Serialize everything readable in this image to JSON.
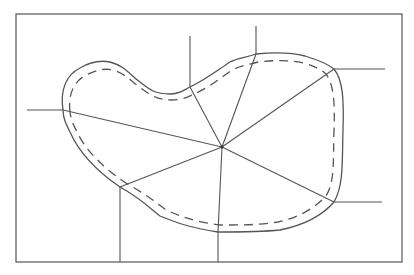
{
  "diagram": {
    "colors": {
      "line": "#555555",
      "background": "#ffffff"
    },
    "frame": {
      "x": 16,
      "y": 14,
      "width": 386,
      "height": 248
    },
    "center": {
      "x": 222,
      "y": 147
    },
    "boundary_points": [
      {
        "name": "left",
        "x": 63,
        "y": 110,
        "external_end": {
          "x": 27,
          "y": 110
        }
      },
      {
        "name": "top-left",
        "x": 190,
        "y": 87,
        "external_end": {
          "x": 190,
          "y": 36
        }
      },
      {
        "name": "top",
        "x": 256,
        "y": 54,
        "external_end": {
          "x": 256,
          "y": 26
        }
      },
      {
        "name": "right-top",
        "x": 334,
        "y": 69,
        "external_end": {
          "x": 385,
          "y": 69
        }
      },
      {
        "name": "right-bottom",
        "x": 334,
        "y": 202,
        "external_end": {
          "x": 382,
          "y": 202
        }
      },
      {
        "name": "bottom-left",
        "x": 120,
        "y": 187,
        "external_end": {
          "x": 120,
          "y": 262
        }
      },
      {
        "name": "bottom",
        "x": 218,
        "y": 232,
        "external_end": {
          "x": 218,
          "y": 262
        }
      }
    ]
  }
}
